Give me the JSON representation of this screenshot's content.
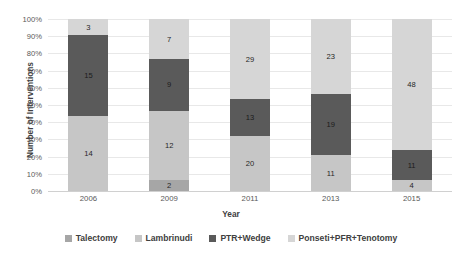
{
  "chart_data": {
    "type": "bar",
    "subtype": "100% stacked column",
    "title": "",
    "xlabel": "Year",
    "ylabel": "Number of Interventions",
    "categories": [
      "2006",
      "2009",
      "2011",
      "2013",
      "2015"
    ],
    "ylim": [
      0,
      100
    ],
    "ytick_labels": [
      "0%",
      "10%",
      "20%",
      "30%",
      "40%",
      "50%",
      "60%",
      "70%",
      "80%",
      "90%",
      "100%"
    ],
    "ytick_values": [
      0,
      10,
      20,
      30,
      40,
      50,
      60,
      70,
      80,
      90,
      100
    ],
    "grid": true,
    "legend_position": "bottom",
    "series": [
      {
        "name": "Talectomy",
        "color": "#a6a6a6",
        "values": [
          0,
          2,
          0,
          0,
          0
        ],
        "labels": [
          "",
          "2",
          "",
          "",
          ""
        ]
      },
      {
        "name": "Lambrinudi",
        "color": "#c6c6c6",
        "values": [
          14,
          12,
          20,
          11,
          4
        ],
        "labels": [
          "14",
          "12",
          "20",
          "11",
          "4"
        ]
      },
      {
        "name": "PTR+Wedge",
        "color": "#5a5a5a",
        "values": [
          15,
          9,
          13,
          19,
          11
        ],
        "labels": [
          "15",
          "9",
          "13",
          "19",
          "11"
        ]
      },
      {
        "name": "Ponseti+PFR+Tenotomy",
        "color": "#d6d6d6",
        "values": [
          3,
          7,
          29,
          23,
          48
        ],
        "labels": [
          "3",
          "7",
          "29",
          "23",
          "48"
        ]
      }
    ],
    "totals": [
      32,
      30,
      62,
      53,
      63
    ]
  },
  "legend": {
    "items": [
      {
        "label": "Talectomy",
        "color": "#a6a6a6"
      },
      {
        "label": "Lambrinudi",
        "color": "#c6c6c6"
      },
      {
        "label": "PTR+Wedge",
        "color": "#5a5a5a"
      },
      {
        "label": "Ponseti+PFR+Tenotomy",
        "color": "#d6d6d6"
      }
    ]
  }
}
